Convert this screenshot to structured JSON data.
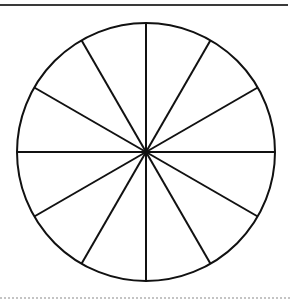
{
  "diagram": {
    "type": "divided-circle",
    "segments": 12,
    "center": [
      146,
      152
    ],
    "radius": 129,
    "stroke_color": "#111111",
    "stroke_width": 2,
    "fill_color": "#ffffff"
  },
  "rules": {
    "top_color": "#3a3a3a",
    "bottom_color": "#c4c4c4"
  }
}
